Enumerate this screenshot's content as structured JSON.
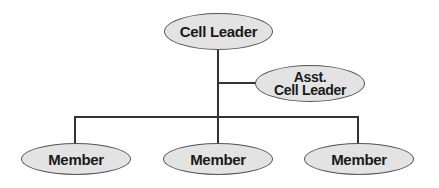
{
  "diagram": {
    "colors": {
      "node_fill": "#e3e3e3",
      "node_border": "#555555",
      "connector": "#333333",
      "text": "#1a1a1a"
    },
    "nodes": {
      "leader": {
        "label": "Cell Leader"
      },
      "assistant": {
        "line1": "Asst.",
        "line2": "Cell Leader"
      },
      "members": [
        {
          "label": "Member"
        },
        {
          "label": "Member"
        },
        {
          "label": "Member"
        }
      ]
    },
    "edges": [
      {
        "from": "Cell Leader",
        "to": "Asst. Cell Leader"
      },
      {
        "from": "Cell Leader",
        "to": "Member 1"
      },
      {
        "from": "Cell Leader",
        "to": "Member 2"
      },
      {
        "from": "Cell Leader",
        "to": "Member 3"
      }
    ]
  }
}
